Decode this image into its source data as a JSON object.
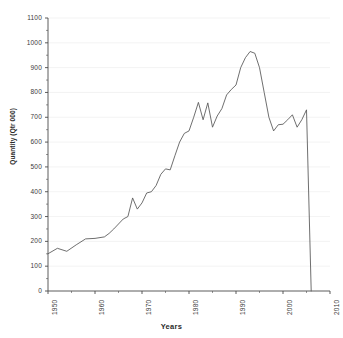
{
  "chart_data": {
    "type": "line",
    "title": "",
    "xlabel": "Years",
    "ylabel": "Quantity (Qtr 000)",
    "xlim": [
      1950,
      2010
    ],
    "ylim": [
      0,
      1100
    ],
    "grid": true,
    "legend": null,
    "xticks": [
      "1950",
      "1960",
      "1970",
      "1980",
      "1990",
      "2000",
      "2010"
    ],
    "xtick_values": [
      1950,
      1960,
      1970,
      1980,
      1990,
      2000,
      2010
    ],
    "yticks": [
      "0",
      "100",
      "200",
      "300",
      "400",
      "500",
      "600",
      "700",
      "800",
      "900",
      "1000",
      "1100"
    ],
    "ytick_values": [
      0,
      100,
      200,
      300,
      400,
      500,
      600,
      700,
      800,
      900,
      1000,
      1100
    ],
    "line_color": "#555555",
    "series": [
      {
        "name": "Quantity",
        "x": [
          1950,
          1951,
          1952,
          1953,
          1954,
          1955,
          1956,
          1957,
          1958,
          1959,
          1960,
          1961,
          1962,
          1963,
          1964,
          1965,
          1966,
          1967,
          1968,
          1969,
          1970,
          1971,
          1972,
          1973,
          1974,
          1975,
          1976,
          1977,
          1978,
          1979,
          1980,
          1981,
          1982,
          1983,
          1984,
          1985,
          1986,
          1987,
          1988,
          1989,
          1990,
          1991,
          1992,
          1993,
          1994,
          1995,
          1996,
          1997,
          1998,
          1999,
          2000,
          2001,
          2002,
          2003,
          2004,
          2005,
          2006
        ],
        "values": [
          150,
          158,
          172,
          165,
          160,
          170,
          186,
          196,
          210,
          214,
          212,
          218,
          216,
          232,
          248,
          262,
          290,
          300,
          375,
          330,
          352,
          392,
          398,
          400,
          420,
          470,
          492,
          488,
          540,
          580,
          620,
          635,
          640,
          700,
          760,
          690,
          755,
          660,
          700,
          730,
          740,
          775,
          800,
          812,
          820,
          860,
          900,
          940,
          965,
          960,
          930,
          880,
          800,
          700,
          645,
          670,
          0
        ]
      }
    ],
    "annotations": [
      {
        "label": "vertical-drop-to-zero",
        "x": 2006,
        "from": 1015,
        "to": 0
      }
    ],
    "detail_points": {
      "x": [
        1950,
        1952,
        1954,
        1956,
        1958,
        1960,
        1962,
        1963,
        1964,
        1966,
        1967,
        1968,
        1969,
        1970,
        1971,
        1972,
        1973,
        1974,
        1975,
        1976,
        1977,
        1978,
        1979,
        1980,
        1981,
        1982,
        1983,
        1984,
        1985,
        1986,
        1987,
        1988,
        1989,
        1990,
        1991,
        1992,
        1993,
        1994,
        1995,
        1996,
        1997,
        1998,
        1999,
        2000,
        2001,
        2002,
        2003,
        2004,
        2005,
        2006
      ],
      "values": [
        150,
        172,
        160,
        186,
        210,
        212,
        218,
        232,
        250,
        290,
        300,
        375,
        330,
        355,
        395,
        400,
        425,
        470,
        492,
        488,
        545,
        600,
        635,
        645,
        700,
        760,
        690,
        758,
        660,
        705,
        735,
        790,
        812,
        830,
        900,
        940,
        965,
        958,
        900,
        800,
        700,
        645,
        670,
        672,
        690,
        710,
        660,
        690,
        730,
        0
      ]
    }
  },
  "axes": {
    "y_title": "Quantity (Qtr 000)",
    "x_title": "Years"
  }
}
